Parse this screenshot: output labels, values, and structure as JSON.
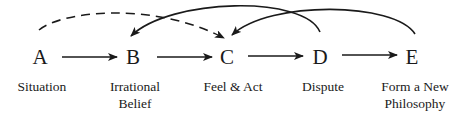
{
  "diagram": {
    "nodes": [
      {
        "letter": "A",
        "label": "Situation"
      },
      {
        "letter": "B",
        "label": "Irrational\nBelief"
      },
      {
        "letter": "C",
        "label": "Feel & Act"
      },
      {
        "letter": "D",
        "label": "Dispute"
      },
      {
        "letter": "E",
        "label": "Form a New\nPhilosophy"
      }
    ],
    "edges": [
      {
        "from": "A",
        "to": "B",
        "style": "solid",
        "type": "straight"
      },
      {
        "from": "B",
        "to": "C",
        "style": "solid",
        "type": "straight"
      },
      {
        "from": "C",
        "to": "D",
        "style": "solid",
        "type": "straight"
      },
      {
        "from": "D",
        "to": "E",
        "style": "solid",
        "type": "straight"
      },
      {
        "from": "A",
        "to": "C",
        "style": "dashed",
        "type": "curved"
      },
      {
        "from": "D",
        "to": "B",
        "style": "solid",
        "type": "curved"
      },
      {
        "from": "E",
        "to": "C",
        "style": "solid",
        "type": "curved"
      }
    ],
    "colors": {
      "ink": "#1a1a1a",
      "background": "#ffffff"
    }
  }
}
